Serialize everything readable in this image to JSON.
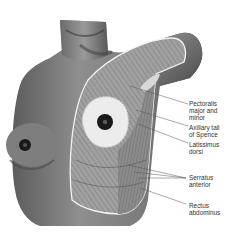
{
  "figure": {
    "labels": [
      {
        "id": "pectoralis",
        "text": "Pectoralis\nmajor and\nminor",
        "x": 189,
        "y": 100
      },
      {
        "id": "axillary-tail",
        "text": "Axillary tail\nof Spence",
        "x": 189,
        "y": 124
      },
      {
        "id": "latissimus",
        "text": "Latissimus\ndorsi",
        "x": 189,
        "y": 141
      },
      {
        "id": "serratus",
        "text": "Serratus\nanterior",
        "x": 189,
        "y": 174
      },
      {
        "id": "rectus",
        "text": "Rectus\nabdominus",
        "x": 189,
        "y": 202
      }
    ],
    "colors": {
      "skin": "#8a8a8a",
      "skin_dark": "#5a5a5a",
      "muscle": "#9c9c9c",
      "gland": "#eeeeee",
      "outline": "#f2f2f2",
      "nipple": "#1a1a1a"
    }
  }
}
